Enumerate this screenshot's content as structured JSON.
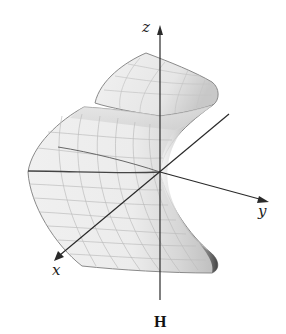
{
  "figure": {
    "caption": "H",
    "axes": {
      "x_label": "x",
      "y_label": "y",
      "z_label": "z"
    },
    "colors": {
      "surface_light": "#f4f4f4",
      "surface_mid": "#dcdcdc",
      "surface_shadow": "#555555",
      "grid": "#bdbdbd",
      "edge": "#8a8a8a",
      "axis": "#2a2a2a"
    }
  }
}
